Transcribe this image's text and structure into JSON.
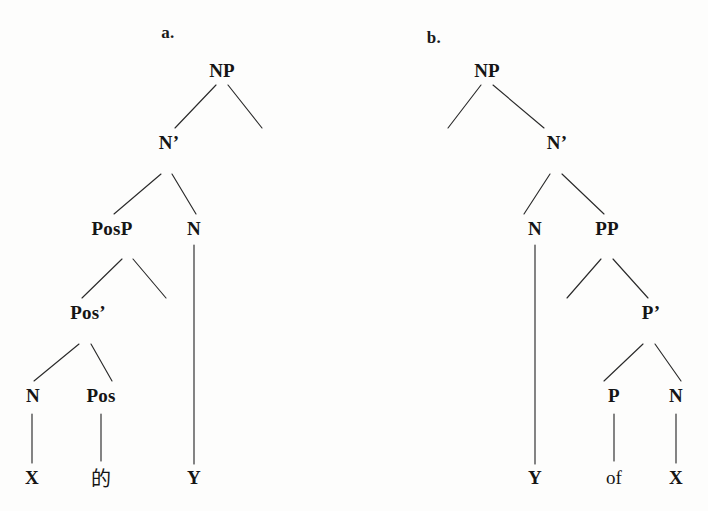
{
  "figure": {
    "type": "syntax-tree-pair",
    "background_color": "#fdfdfc",
    "line_color": "#2a2a2a",
    "text_color": "#151515"
  },
  "trees": [
    {
      "id": "a",
      "label": "a.",
      "label_pos": {
        "x": 168,
        "y": 33
      },
      "description": "Chinese possessive NP structure with PosP specifier",
      "nodes": [
        {
          "name": "np",
          "text": "NP",
          "x": 222,
          "y": 71
        },
        {
          "name": "nbar",
          "text": "N’",
          "x": 169,
          "y": 143
        },
        {
          "name": "posp",
          "text": "PosP",
          "x": 112,
          "y": 229
        },
        {
          "name": "n-head",
          "text": "N",
          "x": 194,
          "y": 229
        },
        {
          "name": "posbar",
          "text": "Pos’",
          "x": 88,
          "y": 313
        },
        {
          "name": "n-spec",
          "text": "N",
          "x": 33,
          "y": 396
        },
        {
          "name": "pos",
          "text": "Pos",
          "x": 101,
          "y": 396
        },
        {
          "name": "term-x",
          "text": "X",
          "x": 32,
          "y": 478
        },
        {
          "name": "term-de",
          "text": "的",
          "x": 101,
          "y": 477
        },
        {
          "name": "term-y",
          "text": "Y",
          "x": 194,
          "y": 478
        }
      ],
      "edges": [
        {
          "name": "np-to-nbar",
          "x1": 216,
          "y1": 85,
          "x2": 175,
          "y2": 128
        },
        {
          "name": "np-to-right-empty",
          "x1": 228,
          "y1": 85,
          "x2": 262,
          "y2": 128
        },
        {
          "name": "nbar-to-posp",
          "x1": 161,
          "y1": 174,
          "x2": 114,
          "y2": 214
        },
        {
          "name": "nbar-to-n",
          "x1": 172,
          "y1": 174,
          "x2": 196,
          "y2": 214
        },
        {
          "name": "posp-to-posbar",
          "x1": 122,
          "y1": 259,
          "x2": 82,
          "y2": 298
        },
        {
          "name": "posp-to-right-empty",
          "x1": 133,
          "y1": 259,
          "x2": 166,
          "y2": 298
        },
        {
          "name": "posbar-to-n",
          "x1": 79,
          "y1": 344,
          "x2": 34,
          "y2": 381
        },
        {
          "name": "posbar-to-pos",
          "x1": 91,
          "y1": 344,
          "x2": 112,
          "y2": 381
        },
        {
          "name": "n-to-x",
          "x1": 32,
          "y1": 414,
          "x2": 32,
          "y2": 463
        },
        {
          "name": "pos-to-de",
          "x1": 101,
          "y1": 414,
          "x2": 101,
          "y2": 461
        },
        {
          "name": "n-head-to-y",
          "x1": 194,
          "y1": 245,
          "x2": 194,
          "y2": 464
        }
      ]
    },
    {
      "id": "b",
      "label": "b.",
      "label_pos": {
        "x": 434,
        "y": 38
      },
      "description": "English of-genitive NP structure with PP complement",
      "nodes": [
        {
          "name": "np",
          "text": "NP",
          "x": 487,
          "y": 71
        },
        {
          "name": "nbar",
          "text": "N’",
          "x": 557,
          "y": 143
        },
        {
          "name": "n-head",
          "text": "N",
          "x": 535,
          "y": 229
        },
        {
          "name": "pp",
          "text": "PP",
          "x": 607,
          "y": 229
        },
        {
          "name": "pbar",
          "text": "P’",
          "x": 651,
          "y": 313
        },
        {
          "name": "p",
          "text": "P",
          "x": 614,
          "y": 396
        },
        {
          "name": "n-comp",
          "text": "N",
          "x": 676,
          "y": 396
        },
        {
          "name": "term-y",
          "text": "Y",
          "x": 535,
          "y": 478
        },
        {
          "name": "term-of",
          "text": "of",
          "x": 614,
          "y": 478
        },
        {
          "name": "term-x",
          "text": "X",
          "x": 676,
          "y": 478
        }
      ],
      "edges": [
        {
          "name": "np-to-left-empty",
          "x1": 481,
          "y1": 85,
          "x2": 448,
          "y2": 128
        },
        {
          "name": "np-to-nbar",
          "x1": 493,
          "y1": 85,
          "x2": 544,
          "y2": 128
        },
        {
          "name": "nbar-to-n",
          "x1": 550,
          "y1": 174,
          "x2": 524,
          "y2": 214
        },
        {
          "name": "nbar-to-pp",
          "x1": 562,
          "y1": 174,
          "x2": 604,
          "y2": 214
        },
        {
          "name": "pp-to-left-empty",
          "x1": 601,
          "y1": 259,
          "x2": 567,
          "y2": 298
        },
        {
          "name": "pp-to-pbar",
          "x1": 613,
          "y1": 259,
          "x2": 648,
          "y2": 298
        },
        {
          "name": "pbar-to-p",
          "x1": 643,
          "y1": 344,
          "x2": 604,
          "y2": 381
        },
        {
          "name": "pbar-to-n",
          "x1": 655,
          "y1": 344,
          "x2": 681,
          "y2": 381
        },
        {
          "name": "p-to-of",
          "x1": 614,
          "y1": 414,
          "x2": 614,
          "y2": 461
        },
        {
          "name": "n-comp-to-x",
          "x1": 676,
          "y1": 414,
          "x2": 676,
          "y2": 463
        },
        {
          "name": "n-head-to-y",
          "x1": 535,
          "y1": 245,
          "x2": 535,
          "y2": 464
        }
      ]
    }
  ]
}
